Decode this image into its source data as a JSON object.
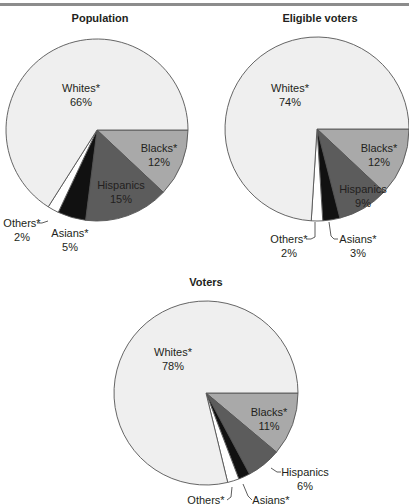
{
  "header": {
    "cutoff_text": ""
  },
  "chart_data": [
    {
      "type": "pie",
      "title": "Population",
      "categories": [
        "Blacks*",
        "Hispanics",
        "Asians*",
        "Others*",
        "Whites*"
      ],
      "values": [
        12,
        15,
        5,
        2,
        66
      ],
      "labels": [
        "12%",
        "15%",
        "5%",
        "2%",
        "66%"
      ],
      "colors": [
        "#a9a9a9",
        "#5c5c5c",
        "#111111",
        "#ffffff",
        "#efefef"
      ],
      "start_angle_deg": 0,
      "direction": "clockwise"
    },
    {
      "type": "pie",
      "title": "Eligible voters",
      "categories": [
        "Blacks*",
        "Hispanics",
        "Asians*",
        "Others*",
        "Whites*"
      ],
      "values": [
        12,
        9,
        3,
        2,
        74
      ],
      "labels": [
        "12%",
        "9%",
        "3%",
        "2%",
        "74%"
      ],
      "colors": [
        "#a9a9a9",
        "#5c5c5c",
        "#111111",
        "#ffffff",
        "#efefef"
      ],
      "start_angle_deg": 0,
      "direction": "clockwise"
    },
    {
      "type": "pie",
      "title": "Voters",
      "categories": [
        "Blacks*",
        "Hispanics",
        "Asians*",
        "Others*",
        "Whites*"
      ],
      "values": [
        11,
        6,
        2,
        2,
        78
      ],
      "labels": [
        "11%",
        "6%",
        "",
        "",
        "78%"
      ],
      "colors": [
        "#a9a9a9",
        "#5c5c5c",
        "#111111",
        "#ffffff",
        "#efefef"
      ],
      "start_angle_deg": 0,
      "direction": "clockwise"
    }
  ],
  "charts": {
    "population": {
      "title": "Population",
      "whites": {
        "name": "Whites*",
        "pct": "66%"
      },
      "blacks": {
        "name": "Blacks*",
        "pct": "12%"
      },
      "hispanics": {
        "name": "Hispanics",
        "pct": "15%"
      },
      "asians": {
        "name": "Asians*",
        "pct": "5%"
      },
      "others": {
        "name": "Others*",
        "pct": "2%"
      }
    },
    "eligible": {
      "title": "Eligible voters",
      "whites": {
        "name": "Whites*",
        "pct": "74%"
      },
      "blacks": {
        "name": "Blacks*",
        "pct": "12%"
      },
      "hispanics": {
        "name": "Hispanics",
        "pct": "9%"
      },
      "asians": {
        "name": "Asians*",
        "pct": "3%"
      },
      "others": {
        "name": "Others*",
        "pct": "2%"
      }
    },
    "voters": {
      "title": "Voters",
      "whites": {
        "name": "Whites*",
        "pct": "78%"
      },
      "blacks": {
        "name": "Blacks*",
        "pct": "11%"
      },
      "hispanics": {
        "name": "Hispanics",
        "pct": "6%"
      },
      "asians": {
        "name": "Asians*"
      },
      "others": {
        "name": "Others*"
      }
    }
  }
}
